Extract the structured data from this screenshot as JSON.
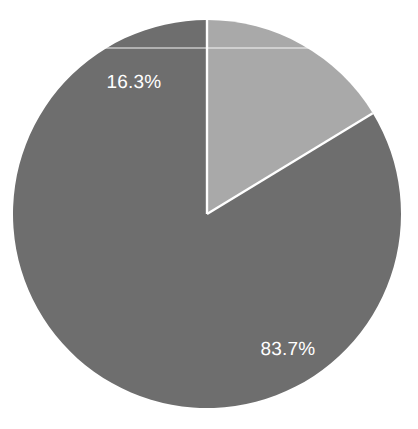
{
  "chart_data": {
    "type": "pie",
    "title": "",
    "subtitle": "",
    "xlabel": "",
    "ylabel": "",
    "legend_position": "none",
    "grid": false,
    "categories": [
      "Majority share",
      "Minority share"
    ],
    "values": [
      83.7,
      16.3
    ],
    "labels": [
      "83.7%",
      "16.3%"
    ],
    "colors": [
      "#6e6e6e",
      "#a9a9a9"
    ],
    "units": "percent",
    "total": 100,
    "start_angle_deg": 90,
    "direction": "counterclockwise",
    "slices": [
      {
        "name": "Majority share",
        "value": 83.7,
        "label": "83.7%",
        "color": "#6e6e6e",
        "angle_deg": 301.3,
        "label_x": 288,
        "label_y": 350
      },
      {
        "name": "Minority share",
        "value": 16.3,
        "label": "16.3%",
        "color": "#a9a9a9",
        "angle_deg": 58.7,
        "label_x": 134,
        "label_y": 83
      }
    ]
  },
  "figure": {
    "width": 418,
    "height": 429,
    "background_color": "#ffffff",
    "center_x": 207,
    "center_y": 214,
    "radius": 194,
    "separator_color": "#ffffff",
    "separator_width": 2.4,
    "label_color": "#ffffff",
    "label_font_size": 19
  }
}
